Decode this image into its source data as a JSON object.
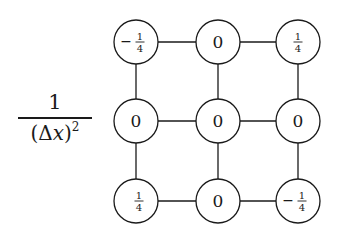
{
  "diagram": {
    "coefficient": {
      "numerator": "1",
      "denominator_open": "(",
      "denominator_delta": "Δ",
      "denominator_var": "x",
      "denominator_close": ")",
      "denominator_exp": "2"
    },
    "grid": {
      "rows": 3,
      "cols": 3,
      "nodes": [
        [
          {
            "sign": "−",
            "num": "1",
            "den": "4",
            "type": "fraction"
          },
          {
            "value": "0",
            "type": "integer"
          },
          {
            "sign": "",
            "num": "1",
            "den": "4",
            "type": "fraction"
          }
        ],
        [
          {
            "value": "0",
            "type": "integer"
          },
          {
            "value": "0",
            "type": "integer"
          },
          {
            "value": "0",
            "type": "integer"
          }
        ],
        [
          {
            "sign": "",
            "num": "1",
            "den": "4",
            "type": "fraction"
          },
          {
            "value": "0",
            "type": "integer"
          },
          {
            "sign": "−",
            "num": "1",
            "den": "4",
            "type": "fraction"
          }
        ]
      ]
    },
    "colors": {
      "stroke": "#1a1a1a",
      "background": "#ffffff"
    }
  }
}
